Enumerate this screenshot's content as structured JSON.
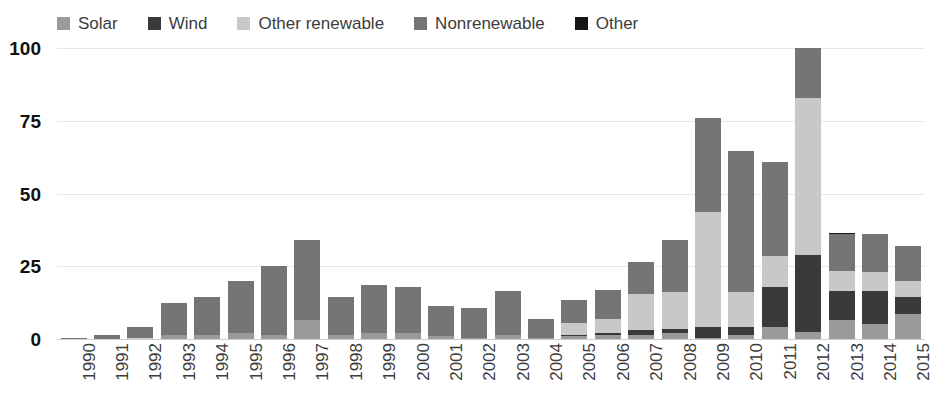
{
  "chart_data": {
    "type": "bar",
    "subtype": "stacked-bar",
    "title": "",
    "xlabel": "",
    "ylabel": "",
    "ylim": [
      0,
      100
    ],
    "yticks": [
      0,
      25,
      50,
      75,
      100
    ],
    "ytick_labels": [
      "0",
      "25",
      "50",
      "75",
      "100"
    ],
    "grid": true,
    "legend_position": "top-left",
    "categories": [
      "1990",
      "1991",
      "1992",
      "1993",
      "1994",
      "1995",
      "1996",
      "1997",
      "1998",
      "1999",
      "2000",
      "2001",
      "2002",
      "2003",
      "2004",
      "2005",
      "2006",
      "2007",
      "2008",
      "2009",
      "2010",
      "2011",
      "2012",
      "2013",
      "2014",
      "2015"
    ],
    "series": [
      {
        "name": "Solar",
        "color": "#9a9a9a",
        "values": [
          0,
          0,
          0,
          1.5,
          1.5,
          2.0,
          1.5,
          6.5,
          1.5,
          2.0,
          2.0,
          1.0,
          0.5,
          1.5,
          0.5,
          1.0,
          1.5,
          1.5,
          2.0,
          0.5,
          1.5,
          4.0,
          2.5,
          6.5,
          5.0,
          8.5
        ]
      },
      {
        "name": "Wind",
        "color": "#3a3a3a",
        "values": [
          0,
          0,
          0,
          0,
          0,
          0,
          0,
          0,
          0,
          0,
          0,
          0,
          0,
          0,
          0,
          0.5,
          0.5,
          1.5,
          1.5,
          3.5,
          2.5,
          14.0,
          26.5,
          10.0,
          11.5,
          6.0
        ]
      },
      {
        "name": "Other renewable",
        "color": "#c8c8c8",
        "values": [
          0,
          0,
          0.5,
          0,
          0,
          0,
          0,
          0,
          0,
          0,
          0,
          0,
          0,
          0,
          0,
          4.0,
          5.0,
          12.5,
          12.5,
          39.5,
          12.0,
          10.5,
          54.0,
          7.0,
          6.5,
          5.5
        ]
      },
      {
        "name": "Nonrenewable",
        "color": "#757575",
        "values": [
          0.3,
          1.5,
          3.5,
          11.0,
          13.0,
          18.0,
          23.5,
          27.5,
          13.0,
          16.5,
          16.0,
          10.5,
          10.0,
          15.0,
          6.5,
          8.0,
          10.0,
          11.0,
          18.0,
          32.5,
          48.5,
          32.5,
          17.0,
          12.5,
          13.0,
          12.0
        ]
      },
      {
        "name": "Other",
        "color": "#151515",
        "values": [
          0,
          0,
          0,
          0,
          0,
          0,
          0,
          0,
          0,
          0,
          0,
          0,
          0,
          0,
          0,
          0,
          0,
          0,
          0,
          0,
          0,
          0,
          0,
          0.5,
          0,
          0
        ]
      }
    ],
    "totals": [
      0.3,
      1.5,
      4.0,
      12.5,
      14.5,
      20.0,
      25.0,
      34.0,
      14.5,
      18.5,
      18.0,
      11.5,
      10.5,
      16.5,
      7.0,
      13.5,
      17.0,
      26.5,
      34.0,
      76.0,
      64.5,
      61.0,
      100.0,
      36.5,
      36.0,
      32.0
    ]
  },
  "legend": {
    "items": [
      {
        "label": "Solar",
        "color": "#9a9a9a",
        "swatch_name": "legend-swatch-solar"
      },
      {
        "label": "Wind",
        "color": "#3a3a3a",
        "swatch_name": "legend-swatch-wind"
      },
      {
        "label": "Other renewable",
        "color": "#c8c8c8",
        "swatch_name": "legend-swatch-other-renewable"
      },
      {
        "label": "Nonrenewable",
        "color": "#757575",
        "swatch_name": "legend-swatch-nonrenewable"
      },
      {
        "label": "Other",
        "color": "#151515",
        "swatch_name": "legend-swatch-other"
      }
    ]
  },
  "colors": {
    "background": "#ffffff",
    "gridline": "#e8e8e8",
    "baseline": "#cfcfcf",
    "tick_label": "#3c3c3c",
    "y_tick_label": "#111111"
  }
}
